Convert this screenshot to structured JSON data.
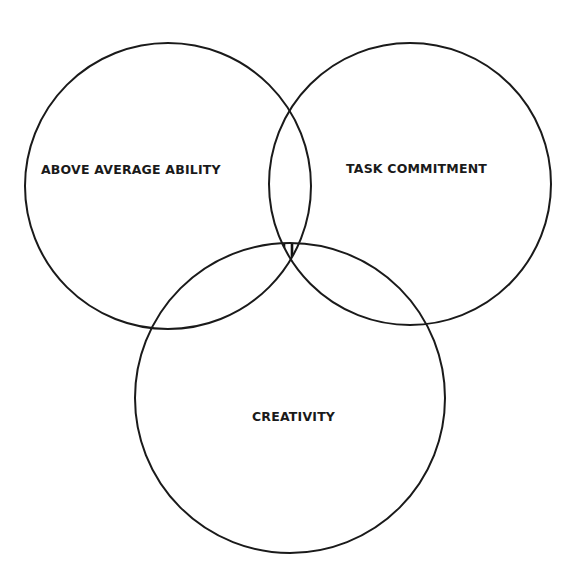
{
  "diagram": {
    "type": "venn",
    "circles": [
      {
        "id": "ability",
        "label": "ABOVE AVERAGE ABILITY",
        "cx": 168,
        "cy": 186,
        "r": 143
      },
      {
        "id": "commitment",
        "label": "TASK COMMITMENT",
        "cx": 410,
        "cy": 184,
        "r": 141
      },
      {
        "id": "creativity",
        "label": "CREATIVITY",
        "cx": 290,
        "cy": 398,
        "r": 155
      }
    ],
    "intersection": {
      "description": "Three-way overlap region shaded with vertical hatching"
    },
    "colors": {
      "stroke": "#1a1a1a",
      "background": "#ffffff"
    }
  }
}
